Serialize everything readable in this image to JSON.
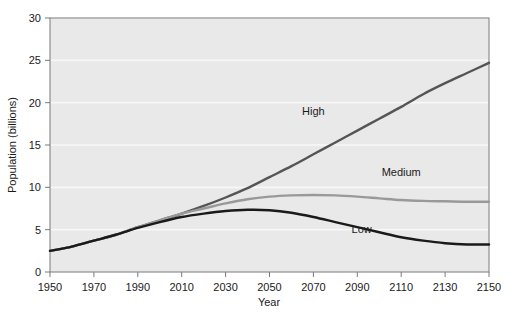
{
  "chart_data": {
    "type": "line",
    "title": "",
    "xlabel": "Year",
    "ylabel": "Population (billions)",
    "xlim": [
      1950,
      2150
    ],
    "ylim": [
      0,
      30
    ],
    "xticks": [
      1950,
      1970,
      1990,
      2010,
      2030,
      2050,
      2070,
      2090,
      2110,
      2130,
      2150
    ],
    "yticks": [
      0,
      5,
      10,
      15,
      20,
      25,
      30
    ],
    "grid": "horizontal-white",
    "legend_position": "inline-annotations",
    "x": [
      1950,
      1960,
      1970,
      1980,
      1990,
      2000,
      2010,
      2020,
      2030,
      2040,
      2050,
      2060,
      2070,
      2080,
      2090,
      2100,
      2110,
      2120,
      2130,
      2140,
      2150
    ],
    "series": [
      {
        "name": "High",
        "color": "#555555",
        "values": [
          2.5,
          3.0,
          3.7,
          4.4,
          5.3,
          6.1,
          6.9,
          7.8,
          8.8,
          9.9,
          11.2,
          12.5,
          13.9,
          15.3,
          16.7,
          18.1,
          19.5,
          21.0,
          22.3,
          23.5,
          24.7
        ]
      },
      {
        "name": "Medium",
        "color": "#999999",
        "values": [
          2.5,
          3.0,
          3.7,
          4.4,
          5.3,
          6.1,
          6.9,
          7.5,
          8.1,
          8.6,
          8.9,
          9.05,
          9.1,
          9.05,
          8.9,
          8.7,
          8.5,
          8.4,
          8.35,
          8.3,
          8.3
        ]
      },
      {
        "name": "Low",
        "color": "#1a1a1a",
        "values": [
          2.5,
          3.0,
          3.7,
          4.4,
          5.2,
          5.9,
          6.5,
          6.9,
          7.2,
          7.35,
          7.3,
          7.0,
          6.5,
          5.9,
          5.3,
          4.7,
          4.1,
          3.7,
          3.4,
          3.25,
          3.25
        ]
      }
    ],
    "annotations": [
      {
        "text": "High",
        "x": 2070,
        "y": 18.5
      },
      {
        "text": "Medium",
        "x": 2110,
        "y": 11.3
      },
      {
        "text": "Low",
        "x": 2092,
        "y": 4.6
      }
    ]
  },
  "plot": {
    "background_color": "#e9e9e9",
    "border_color": "#7a7a7a",
    "gridline_color": "#f7f7f7"
  }
}
